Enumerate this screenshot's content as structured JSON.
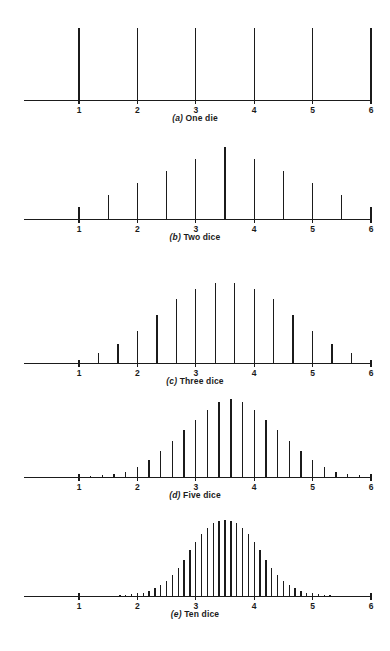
{
  "figure": {
    "axis_tick_labels": [
      "1",
      "2",
      "3",
      "4",
      "5",
      "6"
    ],
    "axis_tick_values": [
      1,
      2,
      3,
      4,
      5,
      6
    ],
    "ink_color": "#1b1b1b",
    "background_color": "#ffffff"
  },
  "panels": [
    {
      "id": "a",
      "index_label": "(a)",
      "caption_text": "One die",
      "caption_full": "(a) One die",
      "n_dice": 1,
      "step": 1
    },
    {
      "id": "b",
      "index_label": "(b)",
      "caption_text": "Two dice",
      "caption_full": "(b) Two dice",
      "n_dice": 2,
      "step": 0.5
    },
    {
      "id": "c",
      "index_label": "(c)",
      "caption_text": "Three dice",
      "caption_full": "(c) Three dice",
      "n_dice": 3,
      "step": 0.3333
    },
    {
      "id": "d",
      "index_label": "(d)",
      "caption_text": "Five dice",
      "caption_full": "(d) Five dice",
      "n_dice": 5,
      "step": 0.2
    },
    {
      "id": "e",
      "index_label": "(e)",
      "caption_text": "Ten dice",
      "caption_full": "(e) Ten dice",
      "n_dice": 10,
      "step": 0.1
    }
  ],
  "chart_data": [
    {
      "type": "bar",
      "title": "(a) One die",
      "xlabel": "",
      "ylabel": "",
      "xlim": [
        0.6,
        6.15
      ],
      "ylim": [
        0,
        1
      ],
      "grid": false,
      "legend": "none",
      "x": [
        1,
        2,
        3,
        4,
        5,
        6
      ],
      "values": [
        1,
        1,
        1,
        1,
        1,
        1
      ],
      "tick_labels": [
        "1",
        "2",
        "3",
        "4",
        "5",
        "6"
      ],
      "notes": "Uniform distribution: each face equally likely."
    },
    {
      "type": "bar",
      "title": "(b) Two dice",
      "xlabel": "",
      "ylabel": "",
      "xlim": [
        0.6,
        6.15
      ],
      "ylim": [
        0,
        1
      ],
      "grid": false,
      "legend": "none",
      "x": [
        1,
        1.5,
        2,
        2.5,
        3,
        3.5,
        4,
        4.5,
        5,
        5.5,
        6
      ],
      "values": [
        0.167,
        0.333,
        0.5,
        0.667,
        0.833,
        1,
        0.833,
        0.667,
        0.5,
        0.333,
        0.167
      ],
      "tick_labels": [
        "1",
        "2",
        "3",
        "4",
        "5",
        "6"
      ],
      "notes": "Triangular distribution of the average of two dice; peak at 3.5."
    },
    {
      "type": "bar",
      "title": "(c) Three dice",
      "xlabel": "",
      "ylabel": "",
      "xlim": [
        0.6,
        6.15
      ],
      "ylim": [
        0,
        1
      ],
      "grid": false,
      "legend": "none",
      "x": [
        1,
        1.333,
        1.667,
        2,
        2.333,
        2.667,
        3,
        3.333,
        3.667,
        4,
        4.333,
        4.667,
        5,
        5.333,
        5.667,
        6
      ],
      "values": [
        0.04,
        0.12,
        0.24,
        0.4,
        0.6,
        0.8,
        0.92,
        1,
        1,
        0.92,
        0.8,
        0.6,
        0.4,
        0.24,
        0.12,
        0.04
      ],
      "tick_labels": [
        "1",
        "2",
        "3",
        "4",
        "5",
        "6"
      ],
      "notes": "Average of three dice; peak between 3.33 and 3.67."
    },
    {
      "type": "bar",
      "title": "(d) Five dice",
      "xlabel": "",
      "ylabel": "",
      "xlim": [
        0.6,
        6.15
      ],
      "ylim": [
        0,
        1
      ],
      "grid": false,
      "legend": "none",
      "x": [
        1,
        1.2,
        1.4,
        1.6,
        1.8,
        2,
        2.2,
        2.4,
        2.6,
        2.8,
        3,
        3.2,
        3.4,
        3.6,
        3.8,
        4,
        4.2,
        4.4,
        4.6,
        4.8,
        5,
        5.2,
        5.4,
        5.6,
        5.8,
        6
      ],
      "values": [
        0.004,
        0.01,
        0.02,
        0.035,
        0.07,
        0.13,
        0.22,
        0.33,
        0.46,
        0.6,
        0.73,
        0.86,
        0.96,
        1,
        0.96,
        0.86,
        0.73,
        0.6,
        0.46,
        0.33,
        0.22,
        0.13,
        0.07,
        0.035,
        0.02,
        0.01
      ],
      "tick_labels": [
        "1",
        "2",
        "3",
        "4",
        "5",
        "6"
      ],
      "notes": "Average of five dice; nearly bell-shaped, peak at 3.4-3.6."
    },
    {
      "type": "bar",
      "title": "(e) Ten dice",
      "xlabel": "",
      "ylabel": "",
      "xlim": [
        0.6,
        6.15
      ],
      "ylim": [
        0,
        1
      ],
      "grid": false,
      "legend": "none",
      "x": [
        1,
        1.1,
        1.2,
        1.3,
        1.4,
        1.5,
        1.6,
        1.7,
        1.8,
        1.9,
        2,
        2.1,
        2.2,
        2.3,
        2.4,
        2.5,
        2.6,
        2.7,
        2.8,
        2.9,
        3,
        3.1,
        3.2,
        3.3,
        3.4,
        3.5,
        3.6,
        3.7,
        3.8,
        3.9,
        4,
        4.1,
        4.2,
        4.3,
        4.4,
        4.5,
        4.6,
        4.7,
        4.8,
        4.9,
        5,
        5.1,
        5.2,
        5.3,
        5.4,
        5.5,
        5.6,
        5.7,
        5.8,
        5.9,
        6
      ],
      "values": [
        0.001,
        0.001,
        0.002,
        0.002,
        0.003,
        0.004,
        0.006,
        0.009,
        0.013,
        0.02,
        0.03,
        0.045,
        0.07,
        0.1,
        0.14,
        0.2,
        0.28,
        0.37,
        0.48,
        0.6,
        0.71,
        0.82,
        0.9,
        0.96,
        0.99,
        1,
        0.99,
        0.96,
        0.9,
        0.82,
        0.71,
        0.6,
        0.48,
        0.37,
        0.28,
        0.2,
        0.14,
        0.1,
        0.07,
        0.045,
        0.03,
        0.02,
        0.013,
        0.009,
        0.006,
        0.004,
        0.003,
        0.002,
        0.002,
        0.001,
        0.001
      ],
      "tick_labels": [
        "1",
        "2",
        "3",
        "4",
        "5",
        "6"
      ],
      "notes": "Average of ten dice; closely approximates a normal curve centered at 3.5."
    }
  ],
  "layout": {
    "axis_left_px": 24,
    "axis_right_px": 372,
    "x_at_one_px": 79,
    "px_per_unit": 58.4,
    "panels_geometry": [
      {
        "baseline_y": 100,
        "spike_max_h": 72,
        "caption_y": 113
      },
      {
        "baseline_y": 219,
        "spike_max_h": 72,
        "caption_y": 232
      },
      {
        "baseline_y": 363,
        "spike_max_h": 80,
        "caption_y": 376
      },
      {
        "baseline_y": 477,
        "spike_max_h": 78,
        "caption_y": 490
      },
      {
        "baseline_y": 596,
        "spike_max_h": 76,
        "caption_y": 609
      }
    ]
  }
}
